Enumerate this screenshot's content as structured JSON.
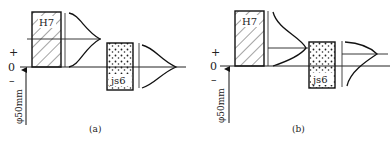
{
  "figure": {
    "panels": [
      {
        "id": "a",
        "caption": "(a)",
        "hole_label": "H7",
        "shaft_label": "js6",
        "sign_plus": "+",
        "sign_zero": "0",
        "sign_minus": "–",
        "dimension_label": "φ50mm"
      },
      {
        "id": "b",
        "caption": "(b)",
        "hole_label": "H7",
        "shaft_label": "js6",
        "sign_plus": "+",
        "sign_zero": "0",
        "sign_minus": "–",
        "dimension_label": "φ50mm"
      }
    ]
  }
}
